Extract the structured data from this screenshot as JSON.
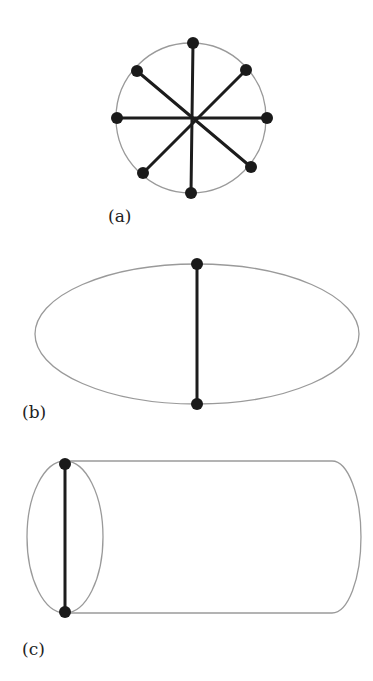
{
  "figures": [
    {
      "id": "a",
      "label": "(a)",
      "shape": "circle",
      "description": "Circle with 8 boundary points joined through the center",
      "circle": {
        "cx": 191,
        "cy": 118,
        "r": 75
      },
      "nodes": [
        {
          "x": 193,
          "y": 43
        },
        {
          "x": 246,
          "y": 70
        },
        {
          "x": 267,
          "y": 118
        },
        {
          "x": 251,
          "y": 167
        },
        {
          "x": 191,
          "y": 193
        },
        {
          "x": 143,
          "y": 173
        },
        {
          "x": 117,
          "y": 118
        },
        {
          "x": 137,
          "y": 71
        }
      ],
      "edges": [
        [
          0,
          4
        ],
        [
          1,
          5
        ],
        [
          2,
          6
        ],
        [
          3,
          7
        ]
      ],
      "label_pos": {
        "x": 108,
        "y": 222
      }
    },
    {
      "id": "b",
      "label": "(b)",
      "shape": "ellipse",
      "description": "Ellipse with a vertical chord",
      "ellipse": {
        "cx": 197,
        "cy": 334,
        "rx": 162,
        "ry": 70
      },
      "nodes": [
        {
          "x": 197,
          "y": 264
        },
        {
          "x": 197,
          "y": 404
        }
      ],
      "edges": [
        [
          0,
          1
        ]
      ],
      "label_pos": {
        "x": 22,
        "y": 418
      }
    },
    {
      "id": "c",
      "label": "(c)",
      "shape": "cylinder",
      "description": "Cylinder with a chord across its left elliptical end",
      "left_ellipse": {
        "cx": 65,
        "cy": 537,
        "rx": 38,
        "ry": 76
      },
      "body": {
        "x_left": 65,
        "x_right": 332,
        "y_top": 461,
        "y_bottom": 613,
        "cap_rx": 29
      },
      "nodes": [
        {
          "x": 65,
          "y": 464
        },
        {
          "x": 65,
          "y": 612
        }
      ],
      "edges": [
        [
          0,
          1
        ]
      ],
      "label_pos": {
        "x": 22,
        "y": 655
      }
    }
  ],
  "colors": {
    "outline": "#9a9a9a",
    "edge": "#1c1c1c",
    "node": "#1a1a1a",
    "background": "#ffffff"
  }
}
